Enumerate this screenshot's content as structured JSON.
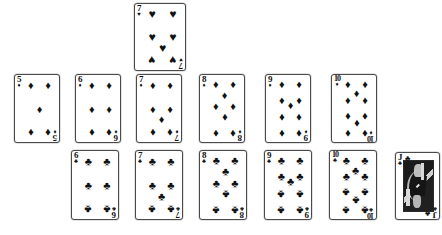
{
  "scene": {
    "name": "playing-card-spread",
    "background_color": "#ffffff",
    "card_face_color": "#ffffff",
    "card_border_color": "#4a4a4a",
    "pip_color": "#111111"
  },
  "suit_glyphs": {
    "hearts": "♥",
    "diamonds": "♦",
    "clubs": "♣",
    "spades": "♠"
  },
  "cards": [
    {
      "id": "card-7-hearts",
      "rank": "7",
      "suit": "hearts",
      "suit_glyph": "♥",
      "label": "7 of Hearts",
      "row": "top",
      "x": 134,
      "y": 3,
      "width": 52,
      "height": 68,
      "pip_layout": "seven"
    },
    {
      "id": "card-5-diamonds",
      "rank": "5",
      "suit": "diamonds",
      "suit_glyph": "♦",
      "label": "5 of Diamonds",
      "row": "middle",
      "x": 14,
      "y": 74,
      "width": 46,
      "height": 69,
      "pip_layout": "five"
    },
    {
      "id": "card-6-diamonds",
      "rank": "6",
      "suit": "diamonds",
      "suit_glyph": "♦",
      "label": "6 of Diamonds",
      "row": "middle",
      "x": 75,
      "y": 74,
      "width": 46,
      "height": 69,
      "pip_layout": "six"
    },
    {
      "id": "card-7-diamonds",
      "rank": "7",
      "suit": "diamonds",
      "suit_glyph": "♦",
      "label": "7 of Diamonds",
      "row": "middle",
      "x": 136,
      "y": 74,
      "width": 46,
      "height": 69,
      "pip_layout": "seven"
    },
    {
      "id": "card-8-diamonds",
      "rank": "8",
      "suit": "diamonds",
      "suit_glyph": "♦",
      "label": "8 of Diamonds",
      "row": "middle",
      "x": 199,
      "y": 74,
      "width": 46,
      "height": 69,
      "pip_layout": "eight"
    },
    {
      "id": "card-9-diamonds",
      "rank": "9",
      "suit": "diamonds",
      "suit_glyph": "♦",
      "label": "9 of Diamonds",
      "row": "middle",
      "x": 265,
      "y": 74,
      "width": 46,
      "height": 69,
      "pip_layout": "nine"
    },
    {
      "id": "card-10-diamonds",
      "rank": "10",
      "suit": "diamonds",
      "suit_glyph": "♦",
      "label": "10 of Diamonds",
      "row": "middle",
      "x": 331,
      "y": 74,
      "width": 46,
      "height": 69,
      "pip_layout": "ten"
    },
    {
      "id": "card-6-clubs",
      "rank": "6",
      "suit": "clubs",
      "suit_glyph": "♣",
      "label": "6 of Clubs",
      "row": "bottom",
      "x": 71,
      "y": 150,
      "width": 48,
      "height": 70,
      "pip_layout": "six"
    },
    {
      "id": "card-7-clubs",
      "rank": "7",
      "suit": "clubs",
      "suit_glyph": "♣",
      "label": "7 of Clubs",
      "row": "bottom",
      "x": 135,
      "y": 150,
      "width": 48,
      "height": 70,
      "pip_layout": "seven"
    },
    {
      "id": "card-8-clubs",
      "rank": "8",
      "suit": "clubs",
      "suit_glyph": "♣",
      "label": "8 of Clubs",
      "row": "bottom",
      "x": 199,
      "y": 150,
      "width": 48,
      "height": 70,
      "pip_layout": "eight"
    },
    {
      "id": "card-9-clubs",
      "rank": "9",
      "suit": "clubs",
      "suit_glyph": "♣",
      "label": "9 of Clubs",
      "row": "bottom",
      "x": 264,
      "y": 150,
      "width": 48,
      "height": 70,
      "pip_layout": "nine"
    },
    {
      "id": "card-10-clubs",
      "rank": "10",
      "suit": "clubs",
      "suit_glyph": "♣",
      "label": "10 of Clubs",
      "row": "bottom",
      "x": 329,
      "y": 150,
      "width": 48,
      "height": 70,
      "pip_layout": "ten"
    },
    {
      "id": "card-jack-clubs",
      "rank": "J",
      "suit": "clubs",
      "suit_glyph": "♣",
      "label": "Jack of Clubs",
      "row": "bottom",
      "x": 395,
      "y": 152,
      "width": 45,
      "height": 68,
      "pip_layout": "face"
    }
  ]
}
